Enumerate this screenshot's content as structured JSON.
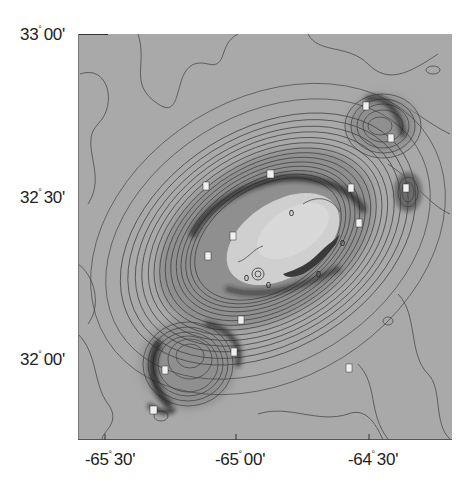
{
  "map": {
    "type": "bathymetric contour map",
    "background_color": "#a9a9a9",
    "contour_color": "#4a4a4a",
    "platform_color": "#c8c8c8",
    "steep_slope_color": "#2a2a2a",
    "zero_contour_label": "0"
  },
  "axes": {
    "y_labels": [
      {
        "deg": "33",
        "min": "00'",
        "text": "33° 00'"
      },
      {
        "deg": "32",
        "min": "30'",
        "text": "32° 30'"
      },
      {
        "deg": "32",
        "min": "00'",
        "text": "32° 00'"
      }
    ],
    "x_labels": [
      {
        "deg": "-65",
        "min": "30'",
        "text": "-65° 30'"
      },
      {
        "deg": "-65",
        "min": "00'",
        "text": "-65° 00'"
      },
      {
        "deg": "-64",
        "min": "30'",
        "text": "-64° 30'"
      }
    ]
  },
  "contour_labels": [
    "0",
    "0",
    "0",
    "0",
    "0"
  ]
}
